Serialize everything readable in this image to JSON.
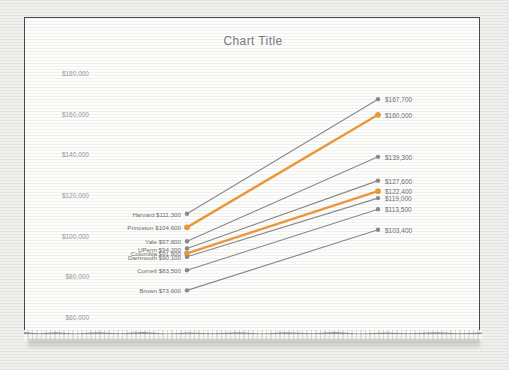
{
  "chart_data": {
    "type": "line",
    "title": "Chart Title",
    "xlabel": "",
    "ylabel": "",
    "ylim": [
      60000,
      185000
    ],
    "yticks": [
      "$180,000",
      "$160,000",
      "$140,000",
      "$120,000",
      "$100,000",
      "$80,000",
      "$60,000"
    ],
    "ytick_values": [
      180000,
      160000,
      140000,
      120000,
      100000,
      80000,
      60000
    ],
    "grid": false,
    "legend": "none",
    "x": [
      "start",
      "end"
    ],
    "series": [
      {
        "name": "Harvard",
        "left_label": "Harvard  $111,300",
        "right_label": "$167,700",
        "values": [
          111300,
          167700
        ],
        "color": "#8c8c8c",
        "highlight": false
      },
      {
        "name": "Princeton",
        "left_label": "Princeton  $104,600",
        "right_label": "$160,000",
        "values": [
          104600,
          160000
        ],
        "color": "#ED9A3D",
        "highlight": true
      },
      {
        "name": "Yale",
        "left_label": "Yale  $97,800",
        "right_label": "$139,300",
        "values": [
          97800,
          139300
        ],
        "color": "#8c8c8c",
        "highlight": false
      },
      {
        "name": "UPenn",
        "left_label": "UPenn  $94,200",
        "right_label": "$127,600",
        "values": [
          94200,
          127600
        ],
        "color": "#8c8c8c",
        "highlight": false
      },
      {
        "name": "Columbia",
        "left_label": "Columbia  $91,800",
        "right_label": "$122,400",
        "values": [
          91800,
          122400
        ],
        "color": "#ED9A3D",
        "highlight": true
      },
      {
        "name": "Dartmouth",
        "left_label": "Dartmouth  $90,100",
        "right_label": "$119,000",
        "values": [
          90100,
          119000
        ],
        "color": "#8c8c8c",
        "highlight": false
      },
      {
        "name": "Cornell",
        "left_label": "Cornell  $83,500",
        "right_label": "$113,500",
        "values": [
          83500,
          113500
        ],
        "color": "#8c8c8c",
        "highlight": false
      },
      {
        "name": "Brown",
        "left_label": "Brown  $73,600",
        "right_label": "$103,400",
        "values": [
          73600,
          103400
        ],
        "color": "#8c8c8c",
        "highlight": false
      }
    ],
    "colors": {
      "default_line": "#8c8c8c",
      "highlight_line": "#ED9A3D",
      "text": "#6f6f6f",
      "axis_text": "#9a9a9a",
      "title": "#7b7b7b"
    }
  }
}
